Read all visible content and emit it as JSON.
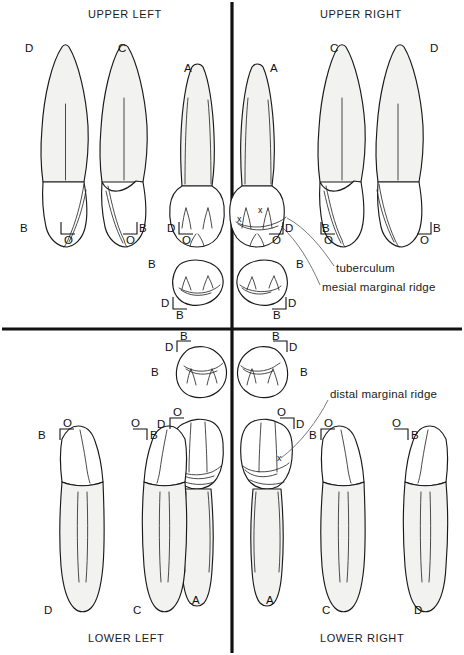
{
  "figure": {
    "type": "dental-anatomy-diagram",
    "width": 464,
    "height": 655,
    "background": "#ffffff",
    "ink_color": "#1a1a1a",
    "enamel_fill": "#ffffff",
    "root_fill": "#f2f2f0"
  },
  "quadrants": {
    "upper_left": {
      "title": "UPPER LEFT"
    },
    "upper_right": {
      "title": "UPPER RIGHT"
    },
    "lower_left": {
      "title": "LOWER LEFT"
    },
    "lower_right": {
      "title": "LOWER RIGHT"
    }
  },
  "annotations": {
    "tuberculum": "tuberculum",
    "mesial_marginal_ridge": "mesial marginal ridge",
    "distal_marginal_ridge": "distal marginal ridge",
    "x_marker": "x"
  },
  "surface_codes": {
    "D": "D",
    "C": "C",
    "B": "B",
    "O": "O",
    "A": "A"
  },
  "teeth": [
    {
      "id": "ul-facial-d",
      "quadrant": "upper_left",
      "view": "facial",
      "labels": [
        {
          "text": "D",
          "pos": "apex-left"
        },
        {
          "text": "B",
          "pos": "incisal-left"
        },
        {
          "text": "O",
          "pos": "incisal-below"
        }
      ]
    },
    {
      "id": "ul-facial-c",
      "quadrant": "upper_left",
      "view": "facial",
      "labels": [
        {
          "text": "C",
          "pos": "apex-right"
        },
        {
          "text": "B",
          "pos": "incisal-right"
        },
        {
          "text": "O",
          "pos": "incisal-below"
        }
      ]
    },
    {
      "id": "ul-lingual",
      "quadrant": "upper_left",
      "view": "lingual",
      "labels": [
        {
          "text": "A",
          "pos": "apex-left"
        },
        {
          "text": "D",
          "pos": "incisal-left"
        },
        {
          "text": "O",
          "pos": "incisal-below"
        }
      ]
    },
    {
      "id": "ul-incisal",
      "quadrant": "upper_left",
      "view": "incisal",
      "labels": [
        {
          "text": "B",
          "pos": "left"
        },
        {
          "text": "D",
          "pos": "lower-left"
        },
        {
          "text": "B",
          "pos": "below"
        }
      ]
    },
    {
      "id": "ur-lingual",
      "quadrant": "upper_right",
      "view": "lingual",
      "labels": [
        {
          "text": "A",
          "pos": "apex-right"
        },
        {
          "text": "D",
          "pos": "incisal-right"
        },
        {
          "text": "O",
          "pos": "incisal-below"
        }
      ],
      "markers": [
        "x",
        "x"
      ]
    },
    {
      "id": "ur-incisal",
      "quadrant": "upper_right",
      "view": "incisal",
      "labels": [
        {
          "text": "B",
          "pos": "right"
        },
        {
          "text": "D",
          "pos": "lower-right"
        },
        {
          "text": "B",
          "pos": "below"
        }
      ]
    },
    {
      "id": "ur-facial-c",
      "quadrant": "upper_right",
      "view": "facial",
      "labels": [
        {
          "text": "C",
          "pos": "apex-left"
        },
        {
          "text": "B",
          "pos": "incisal-left"
        },
        {
          "text": "O",
          "pos": "incisal-below"
        }
      ]
    },
    {
      "id": "ur-facial-d",
      "quadrant": "upper_right",
      "view": "facial",
      "labels": [
        {
          "text": "D",
          "pos": "apex-right"
        },
        {
          "text": "B",
          "pos": "incisal-right"
        },
        {
          "text": "O",
          "pos": "incisal-below"
        }
      ]
    },
    {
      "id": "ll-incisal",
      "quadrant": "lower_left",
      "view": "incisal",
      "labels": [
        {
          "text": "B",
          "pos": "above"
        },
        {
          "text": "D",
          "pos": "upper-left"
        },
        {
          "text": "B",
          "pos": "left"
        }
      ]
    },
    {
      "id": "ll-lingual",
      "quadrant": "lower_left",
      "view": "lingual",
      "labels": [
        {
          "text": "O",
          "pos": "occlusal-above"
        },
        {
          "text": "D",
          "pos": "occlusal-left"
        },
        {
          "text": "A",
          "pos": "apex-below"
        }
      ]
    },
    {
      "id": "ll-facial-d",
      "quadrant": "lower_left",
      "view": "facial",
      "labels": [
        {
          "text": "B",
          "pos": "occlusal-left"
        },
        {
          "text": "O",
          "pos": "occlusal-above"
        },
        {
          "text": "D",
          "pos": "apex-below"
        }
      ]
    },
    {
      "id": "ll-facial-c",
      "quadrant": "lower_left",
      "view": "facial",
      "labels": [
        {
          "text": "O",
          "pos": "occlusal-above"
        },
        {
          "text": "B",
          "pos": "occlusal-right"
        },
        {
          "text": "C",
          "pos": "apex-below"
        }
      ]
    },
    {
      "id": "lr-incisal",
      "quadrant": "lower_right",
      "view": "incisal",
      "labels": [
        {
          "text": "B",
          "pos": "above"
        },
        {
          "text": "D",
          "pos": "upper-right"
        },
        {
          "text": "B",
          "pos": "right"
        }
      ]
    },
    {
      "id": "lr-lingual",
      "quadrant": "lower_right",
      "view": "lingual",
      "labels": [
        {
          "text": "O",
          "pos": "occlusal-above"
        },
        {
          "text": "D",
          "pos": "occlusal-right"
        },
        {
          "text": "A",
          "pos": "apex-below"
        }
      ],
      "markers": [
        "x"
      ]
    },
    {
      "id": "lr-facial-c",
      "quadrant": "lower_right",
      "view": "facial",
      "labels": [
        {
          "text": "B",
          "pos": "occlusal-left"
        },
        {
          "text": "O",
          "pos": "occlusal-above"
        },
        {
          "text": "C",
          "pos": "apex-below"
        }
      ]
    },
    {
      "id": "lr-facial-d",
      "quadrant": "lower_right",
      "view": "facial",
      "labels": [
        {
          "text": "O",
          "pos": "occlusal-above"
        },
        {
          "text": "B",
          "pos": "occlusal-right"
        },
        {
          "text": "D",
          "pos": "apex-below"
        }
      ]
    }
  ],
  "label_instances": {
    "ul_facial_d_apex": "D",
    "ul_facial_c_apex": "C",
    "ul_facial_d_b": "B",
    "ul_facial_d_o": "O",
    "ul_facial_c_b": "B",
    "ul_facial_c_o": "O",
    "ul_lingual_a": "A",
    "ul_lingual_d": "D",
    "ul_lingual_o": "O",
    "ul_incisal_b_left": "B",
    "ul_incisal_d": "D",
    "ul_incisal_b_below": "B",
    "ur_lingual_a": "A",
    "ur_lingual_d": "D",
    "ur_lingual_o": "O",
    "ur_lingual_x1": "x",
    "ur_lingual_x2": "x",
    "ur_incisal_b_right": "B",
    "ur_incisal_d": "D",
    "ur_incisal_b_below": "B",
    "ur_facial_c_apex": "C",
    "ur_facial_d_apex": "D",
    "ur_facial_c_b": "B",
    "ur_facial_c_o": "O",
    "ur_facial_d_b": "B",
    "ur_facial_d_o": "O",
    "ll_incisal_b_above": "B",
    "ll_incisal_d": "D",
    "ll_incisal_b_left": "B",
    "ll_lingual_o": "O",
    "ll_lingual_d": "D",
    "ll_lingual_a": "A",
    "ll_facial_d_b": "B",
    "ll_facial_d_o": "O",
    "ll_facial_c_o": "O",
    "ll_facial_c_b": "B",
    "ll_facial_d_apex": "D",
    "ll_facial_c_apex": "C",
    "lr_incisal_b_above": "B",
    "lr_incisal_d": "D",
    "lr_incisal_b_right": "B",
    "lr_lingual_o": "O",
    "lr_lingual_d": "D",
    "lr_lingual_a": "A",
    "lr_lingual_x": "x",
    "lr_facial_c_b": "B",
    "lr_facial_c_o": "O",
    "lr_facial_d_o": "O",
    "lr_facial_d_b": "B",
    "lr_facial_c_apex": "C",
    "lr_facial_d_apex": "D"
  }
}
